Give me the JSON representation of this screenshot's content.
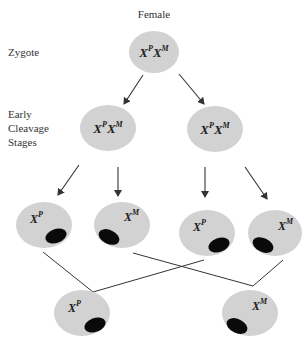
{
  "title": "Female",
  "stage_labels": {
    "zygote": "Zygote",
    "cleavage_line1": "Early",
    "cleavage_line2": "Cleavage",
    "cleavage_line3": "Stages"
  },
  "colors": {
    "cell_fill": "#d2d2d2",
    "barr_body": "#0a0a0a",
    "line": "#333333"
  },
  "cells": {
    "zygote": {
      "base1": "X",
      "sup1": "P",
      "base2": "X",
      "sup2": "M"
    },
    "cleavage_left": {
      "base1": "X",
      "sup1": "P",
      "base2": "X",
      "sup2": "M"
    },
    "cleavage_right": {
      "base1": "X",
      "sup1": "P",
      "base2": "X",
      "sup2": "M"
    },
    "daughter_1": {
      "base": "X",
      "sup": "P",
      "inactive": "maternal"
    },
    "daughter_2": {
      "base": "X",
      "sup": "M",
      "inactive": "paternal"
    },
    "daughter_3": {
      "base": "X",
      "sup": "P",
      "inactive": "maternal"
    },
    "daughter_4": {
      "base": "X",
      "sup": "M",
      "inactive": "paternal"
    },
    "clone_left": {
      "base": "X",
      "sup": "P",
      "inactive": "maternal"
    },
    "clone_right": {
      "base": "X",
      "sup": "M",
      "inactive": "paternal"
    }
  }
}
